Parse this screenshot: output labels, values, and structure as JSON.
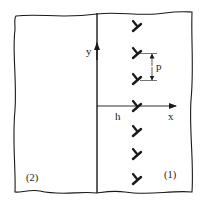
{
  "diagram": {
    "type": "dislocation-wall-near-interface",
    "colors": {
      "background": "#ffffff",
      "stroke": "#1a1a1a",
      "text": "#222222"
    },
    "labels": {
      "y_axis": "y",
      "x_axis": "x",
      "distance": "h",
      "spacing": "p",
      "region_left": "(2)",
      "region_right": "(1)"
    },
    "geometry": {
      "boundary_x": 97,
      "x_axis_y": 106,
      "dislocation_x": 137,
      "dislocation_ys": [
        26,
        53,
        79,
        106,
        131,
        154,
        179
      ],
      "spacing_bracket": {
        "x": 152,
        "y_top": 53,
        "y_bottom": 80
      }
    },
    "dislocation_symbol": "edge-dislocation",
    "dislocation_count": 7
  }
}
